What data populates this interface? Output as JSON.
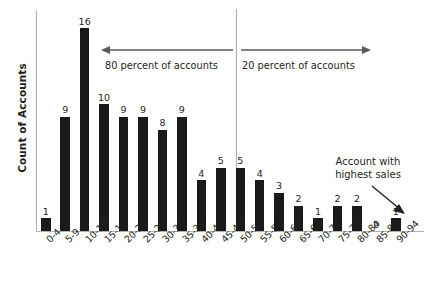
{
  "chart_data": {
    "type": "bar",
    "title": "",
    "subtitle": "",
    "xlabel": "",
    "ylabel": "Count of Accounts",
    "ylim": [
      0,
      16
    ],
    "grid": false,
    "legend": null,
    "bar_color": "#1a1a1a",
    "axis_color": "#b3b3b3",
    "categories": [
      "0-4",
      "5-9",
      "10-14",
      "15-19",
      "20-24",
      "25-29",
      "30-34",
      "35-39",
      "40-44",
      "45-49",
      "50-54",
      "55-59",
      "60-64",
      "65-69",
      "70-74",
      "75-79",
      "80-84",
      "85-89",
      "90-94"
    ],
    "values": [
      1,
      9,
      16,
      10,
      9,
      9,
      8,
      9,
      4,
      5,
      5,
      4,
      3,
      2,
      1,
      2,
      2,
      0,
      1
    ],
    "value_labels": [
      "1",
      "9",
      "16",
      "10",
      "9",
      "9",
      "8",
      "9",
      "4",
      "5",
      "5",
      "4",
      "3",
      "2",
      "1",
      "2",
      "2",
      "0",
      "1"
    ],
    "annotations": [
      {
        "name": "80-percent-band",
        "text": "80 percent of accounts",
        "arrow_direction": "left"
      },
      {
        "name": "20-percent-band",
        "text": "20 percent of accounts",
        "arrow_direction": "right"
      },
      {
        "name": "highest-sales-callout",
        "text_line1": "Account with",
        "text_line2": "highest sales",
        "arrow_direction": "down-right",
        "points_to_category": "90-94"
      }
    ],
    "divider": {
      "name": "pareto-divider",
      "between_categories": [
        "45-49",
        "50-54"
      ]
    }
  }
}
